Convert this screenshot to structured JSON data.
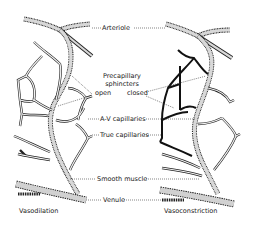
{
  "diagram": {
    "labels": {
      "arteriole": "Arteriole",
      "precapillary_line1": "Precapillary",
      "precapillary_line2": "sphincters",
      "open": "open",
      "closed": "closed",
      "av_capillaries": "A-V capillaries",
      "true_capillaries": "True capillaries",
      "smooth_muscle": "Smooth muscle",
      "venule": "Venule"
    },
    "panels": [
      {
        "caption": "Vasodilation",
        "state": "open"
      },
      {
        "caption": "Vasoconstriction",
        "state": "closed"
      }
    ],
    "colors": {
      "vessel_fill": "#d8d8d8",
      "outline": "#222222",
      "background": "#ffffff"
    }
  }
}
